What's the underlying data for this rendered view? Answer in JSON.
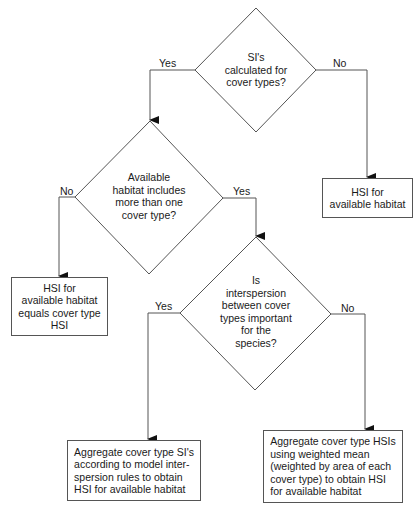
{
  "flowchart": {
    "decisions": [
      {
        "id": "d1",
        "text": "SI's\ncalculated for\ncover types?"
      },
      {
        "id": "d2",
        "text": "Available\nhabitat includes\nmore than one\ncover type?"
      },
      {
        "id": "d3",
        "text": "Is\ninterspersion\nbetween cover\ntypes important\nfor the\nspecies?"
      }
    ],
    "outcomes": [
      {
        "id": "o1",
        "text": "HSI for\navailable habitat"
      },
      {
        "id": "o2",
        "text": "HSI for\navailable habitat\nequals cover type\nHSI"
      },
      {
        "id": "o3",
        "text": "Aggregate cover type SI's\naccording to model inter-\nspersion rules to obtain\nHSI for available habitat"
      },
      {
        "id": "o4",
        "text": "Aggregate cover type HSIs\nusing weighted mean\n(weighted by area of each\ncover type) to obtain HSI\nfor available habitat"
      }
    ],
    "edge_labels": {
      "d1_yes": "Yes",
      "d1_no": "No",
      "d2_no": "No",
      "d2_yes": "Yes",
      "d3_yes": "Yes",
      "d3_no": "No"
    },
    "colors": {
      "line": "#555555",
      "arrow": "#111111",
      "text": "#1a1a1a"
    }
  }
}
